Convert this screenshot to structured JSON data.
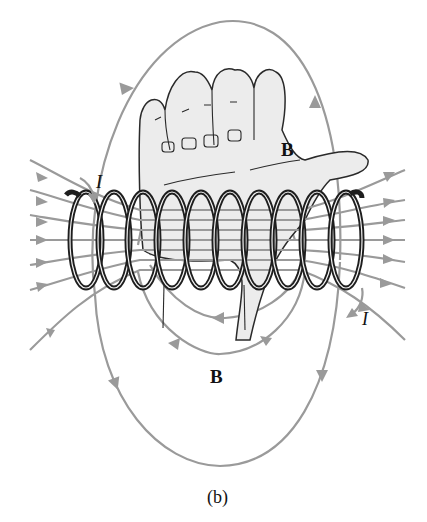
{
  "figure": {
    "labels": {
      "field_top": "B",
      "field_bottom": "B",
      "current_left": "I",
      "current_right": "I"
    },
    "caption": "(b)",
    "colors": {
      "field_lines": "#9a9a9a",
      "coil": "#1e1e1e",
      "hand_fill": "#ececec",
      "background": "#ffffff"
    },
    "coil_turns": 10
  }
}
